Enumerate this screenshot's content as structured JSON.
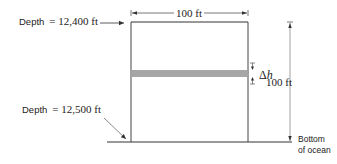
{
  "diagram": {
    "labels": {
      "depth_top": "Depth",
      "depth_top_eq": "= 12,400 ft",
      "depth_bottom": "Depth",
      "depth_bottom_eq": "= 12,500 ft",
      "width_dim": "100 ft",
      "height_dim": "100 ft",
      "delta": "Δ",
      "delta_var": "h",
      "bottom_line1": "Bottom",
      "bottom_line2": "of ocean"
    },
    "colors": {
      "line": "#333333",
      "band": "#a6a6a6",
      "dim_line": "#777777"
    }
  }
}
